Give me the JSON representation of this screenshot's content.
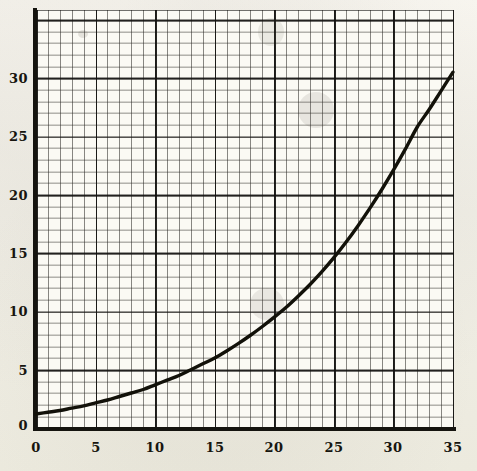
{
  "figure": {
    "medium": "scanned printed graph paper",
    "paper_color": "#f3f1ea",
    "ink_color": "#17150f",
    "grid_minor_color": "#3a3733",
    "grid_major_color": "#141310"
  },
  "chart_data": {
    "type": "line",
    "title": "",
    "subtitle": "",
    "xlabel": "",
    "ylabel": "",
    "xlim": [
      0,
      35
    ],
    "ylim": [
      0,
      35.9
    ],
    "grid": true,
    "grid_minor_step_x": 1,
    "grid_minor_step_y": 1,
    "grid_major_step_x": 5,
    "grid_major_step_y": 5,
    "legend": "none",
    "xticks": [
      0,
      5,
      10,
      15,
      20,
      25,
      30,
      35
    ],
    "xticklabels": [
      "0",
      "5",
      "10",
      "15",
      "20",
      "25",
      "30",
      "35"
    ],
    "yticks": [
      0,
      5,
      10,
      15,
      20,
      25,
      30
    ],
    "yticklabels": [
      "0",
      "5",
      "10",
      "15",
      "20",
      "25",
      "30"
    ],
    "series": [
      {
        "name": "curve",
        "style": "solid-thick",
        "x": [
          0,
          1,
          2,
          3,
          4,
          5,
          6,
          7,
          8,
          9,
          10,
          11,
          12,
          13,
          14,
          15,
          16,
          17,
          18,
          19,
          20,
          21,
          22,
          23,
          24,
          25,
          26,
          27,
          28,
          29,
          30,
          31,
          32,
          33,
          34,
          35
        ],
        "y": [
          1.2,
          1.35,
          1.5,
          1.7,
          1.9,
          2.15,
          2.4,
          2.7,
          3.0,
          3.3,
          3.7,
          4.1,
          4.5,
          5.0,
          5.5,
          6.0,
          6.6,
          7.25,
          7.95,
          8.7,
          9.5,
          10.35,
          11.3,
          12.3,
          13.4,
          14.6,
          15.9,
          17.3,
          18.8,
          20.4,
          22.1,
          23.9,
          25.8,
          27.3,
          28.9,
          30.5
        ]
      }
    ],
    "annotations": []
  },
  "axes": {
    "y_axis_name": "vertical-axis",
    "x_axis_name": "horizontal-axis"
  }
}
